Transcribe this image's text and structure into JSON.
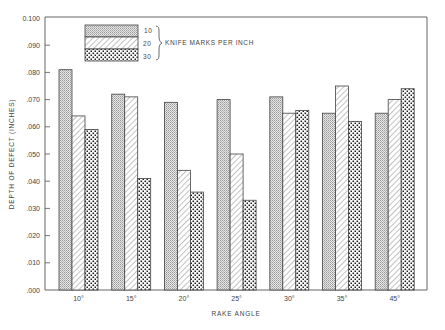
{
  "chart_data": {
    "type": "bar",
    "title": "",
    "xlabel": "RAKE ANGLE",
    "ylabel": "DEPTH OF DEFECT (INCHES)",
    "ylim": [
      0,
      0.1
    ],
    "y_ticks": [
      ".000",
      ".010",
      ".020",
      ".030",
      ".040",
      ".050",
      ".060",
      ".070",
      ".080",
      ".090",
      "0.100"
    ],
    "grid": false,
    "legend_position": "top-left inside",
    "legend_title": "KNIFE MARKS PER INCH",
    "categories": [
      "10°",
      "15°",
      "20°",
      "25°",
      "30°",
      "35°",
      "45°"
    ],
    "series": [
      {
        "name": "10",
        "pattern": "fine-stipple",
        "values": [
          0.081,
          0.072,
          0.069,
          0.07,
          0.071,
          0.065,
          0.065
        ]
      },
      {
        "name": "20",
        "pattern": "diagonal-hatch",
        "values": [
          0.064,
          0.071,
          0.044,
          0.05,
          0.065,
          0.075,
          0.07
        ]
      },
      {
        "name": "30",
        "pattern": "coarse-dots",
        "values": [
          0.059,
          0.041,
          0.036,
          0.033,
          0.066,
          0.062,
          0.074
        ]
      }
    ]
  },
  "colors": {
    "ink": "#333333",
    "stipple": "#bdbdbd",
    "paper": "#ffffff"
  }
}
